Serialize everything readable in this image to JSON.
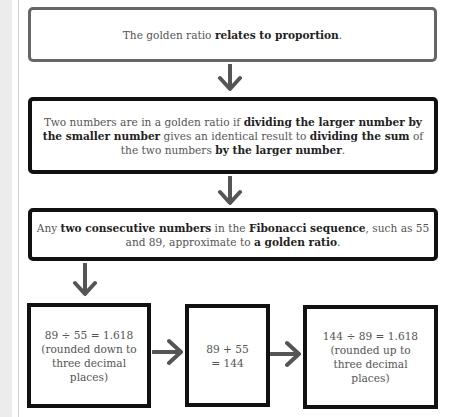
{
  "diagram": {
    "box1": {
      "pre": "The golden ratio ",
      "bold": "relates to proportion",
      "post": "."
    },
    "box2": {
      "t1": "Two numbers are in a golden ratio if ",
      "b1": "dividing the larger number by the smaller number",
      "t2": " gives an identical result to ",
      "b2": "dividing the sum",
      "t3": " of the two numbers ",
      "b3": "by the larger number",
      "t4": "."
    },
    "box3": {
      "t1": "Any ",
      "b1": "two consecutive numbers",
      "t2": " in the ",
      "b2": "Fibonacci sequence",
      "t3": ", such as 55 and 89, approximate to ",
      "b3": "a golden ratio",
      "t4": "."
    },
    "box4": {
      "line1": "89 ÷ 55 = 1.618",
      "line2": "(rounded down to three decimal places)"
    },
    "box5": {
      "line1": "89 + 55",
      "line2": "= 144"
    },
    "box6": {
      "line1": "144 ÷ 89 = 1.618",
      "line2": "(rounded up to three decimal places)"
    },
    "arrows": [
      "arrow-down",
      "arrow-down",
      "arrow-down",
      "arrow-right",
      "arrow-right"
    ],
    "colors": {
      "arrow": "#555555",
      "border_light": "#666666",
      "border_dark": "#111111",
      "margin_strip": "#ececec"
    }
  }
}
